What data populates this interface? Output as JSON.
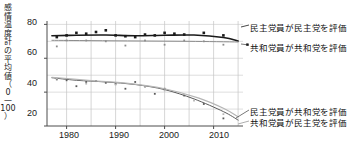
{
  "chart_data": {
    "type": "line",
    "title": "",
    "xlabel": "",
    "ylabel": "感情温度計の平均値（0—100）",
    "ylabel_chars": [
      "感",
      "情",
      "温",
      "度",
      "計",
      "の",
      "平",
      "均",
      "値"
    ],
    "ylabel_paren_open": "（",
    "ylabel_paren_zero": "0",
    "ylabel_paren_dash": "—",
    "ylabel_paren_hundred": "100",
    "ylabel_paren_close": "）",
    "xlim": [
      1976,
      2016
    ],
    "ylim": [
      20,
      82
    ],
    "yticks": [
      20,
      40,
      60,
      80
    ],
    "ytick_labels": [
      "20",
      "40",
      "60",
      "80"
    ],
    "xticks": [
      1980,
      1990,
      2000,
      2010
    ],
    "xtick_labels": [
      "1980",
      "1990",
      "2000",
      "2010"
    ],
    "gridlines_x": [
      1980,
      1985,
      1990,
      1995,
      2000,
      2005,
      2010,
      2015
    ],
    "gridlines_y": [
      30,
      40,
      50,
      60,
      70,
      80
    ],
    "grid": true,
    "legend_position": "right",
    "series": [
      {
        "name": "民主党員が民主党を評価",
        "color": "#1a1a1a",
        "marker": "square",
        "x": [
          1978,
          1980,
          1982,
          1984,
          1986,
          1988,
          1990,
          1992,
          1994,
          1996,
          1998,
          2000,
          2002,
          2004,
          2008,
          2012
        ],
        "y": [
          72.5,
          73.5,
          75.0,
          74.5,
          75.5,
          76.5,
          73.5,
          73.0,
          72.5,
          74.0,
          73.5,
          75.0,
          74.5,
          74.0,
          75.0,
          73.5
        ],
        "trend_x": [
          1977,
          1982,
          1988,
          1994,
          2000,
          2006,
          2012,
          2015
        ],
        "trend_y": [
          73.3,
          73.6,
          73.7,
          73.3,
          73.6,
          73.7,
          72.3,
          70.2
        ]
      },
      {
        "name": "共和党員が共和党を評価",
        "color": "#8c8c8c",
        "marker": "dot",
        "x": [
          1978,
          1980,
          1984,
          1988,
          1992,
          1996,
          2000,
          2004,
          2008,
          2012
        ],
        "y": [
          67.0,
          70.5,
          70.5,
          70.0,
          67.5,
          70.5,
          68.0,
          70.5,
          70.0,
          68.0
        ],
        "trend_x": [
          1977,
          1985,
          1995,
          2005,
          2015
        ],
        "trend_y": [
          70.6,
          70.4,
          70.2,
          70.0,
          69.6
        ]
      },
      {
        "name": "民主党員が共和党を評価",
        "color": "#5a5a5a",
        "marker": "dot",
        "x": [
          1978,
          1980,
          1982,
          1984,
          1986,
          1988,
          1990,
          1992,
          1994,
          1996,
          1998,
          2000,
          2004,
          2008,
          2012
        ],
        "y": [
          47.5,
          47.0,
          43.5,
          46.0,
          46.5,
          45.5,
          45.0,
          42.0,
          46.0,
          43.5,
          39.0,
          42.0,
          38.0,
          33.0,
          24.5
        ],
        "trend_x": [
          1977,
          1982,
          1988,
          1994,
          2000,
          2006,
          2012,
          2015
        ],
        "trend_y": [
          48.5,
          47.0,
          46.0,
          44.5,
          41.5,
          36.0,
          28.5,
          23.5
        ]
      },
      {
        "name": "共和党員が民主党を評価",
        "color": "#b5b5b5",
        "marker": "dot",
        "x": [
          1978,
          1984,
          1990,
          1996,
          2000,
          2006,
          2012
        ],
        "y": [
          48.0,
          45.0,
          44.5,
          43.0,
          41.0,
          35.0,
          27.0
        ],
        "trend_x": [
          1977,
          1985,
          1993,
          2000,
          2007,
          2012,
          2015
        ],
        "trend_y": [
          48.8,
          46.8,
          45.0,
          42.0,
          36.5,
          30.5,
          25.5
        ]
      }
    ],
    "legend_entries": [
      {
        "label": "民主党員が民主党を評価",
        "color": "#1a1a1a"
      },
      {
        "label": "共和党員が共和党を評価",
        "color": "#8c8c8c"
      },
      {
        "label": "民主党員が共和党を評価",
        "color": "#5a5a5a"
      },
      {
        "label": "共和党員が民主党を評価",
        "color": "#b5b5b5"
      }
    ]
  }
}
